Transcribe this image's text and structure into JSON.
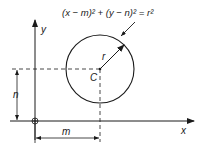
{
  "diagram": {
    "equation": "(x − m)² + (y − n)² = r²",
    "labels": {
      "x_axis": "x",
      "y_axis": "y",
      "center": "C",
      "radius": "r",
      "m_dimension": "m",
      "n_dimension": "n"
    },
    "colors": {
      "stroke": "#1a1a1a",
      "background": "#ffffff"
    }
  }
}
